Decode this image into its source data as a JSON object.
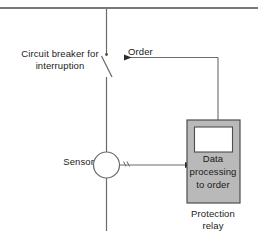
{
  "figure": {
    "type": "single-line-protection-schematic",
    "background_color": "#ffffff",
    "line_color": "#4d4d4d",
    "text_color": "#1a1a1a"
  },
  "labels": {
    "circuit_breaker": "Circuit breaker for\ninterruption",
    "order": "Order",
    "sensor": "Sensor",
    "relay_body": "Data\nprocessing\nto order",
    "relay_caption": "Protection\nrelay"
  },
  "components": {
    "relay_box": {
      "fill_color": "#b9b9b9",
      "stroke_color": "#4d4d4d",
      "inner_window_color": "#ffffff"
    },
    "sensor": {
      "shape": "circle",
      "fill_color": "#ffffff",
      "stroke_color": "#4d4d4d"
    },
    "breaker": {
      "state": "open-contact"
    }
  },
  "signals": {
    "order_arrow_direction": "right-to-left",
    "measurement_arrow_direction": "left-to-right"
  }
}
